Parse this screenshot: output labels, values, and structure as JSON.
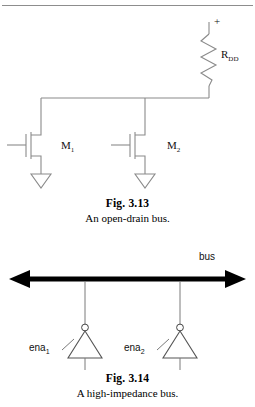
{
  "page": {
    "background": "#ffffff",
    "width": 255,
    "height": 407,
    "has_top_rule": true
  },
  "figures": [
    {
      "id": "fig-3-13",
      "number": "Fig. 3.13",
      "caption": "An open-drain bus.",
      "diagram_type": "circuit-schematic",
      "description": "Open-drain bus with pull-up resistor and two NMOS transistors",
      "labels": {
        "supply_terminal": "+",
        "resistor": {
          "base": "R",
          "subscript": "DD"
        },
        "transistor_1": {
          "base": "M",
          "subscript": "1"
        },
        "transistor_2": {
          "base": "M",
          "subscript": "2"
        }
      },
      "components": [
        {
          "name": "pull-up-resistor",
          "label": "R",
          "sub": "DD"
        },
        {
          "name": "nmos-transistor-m1",
          "label": "M",
          "sub": "1"
        },
        {
          "name": "nmos-transistor-m2",
          "label": "M",
          "sub": "2"
        },
        {
          "name": "ground-symbol-1",
          "label": ""
        },
        {
          "name": "ground-symbol-2",
          "label": ""
        },
        {
          "name": "bus-wire",
          "label": ""
        }
      ]
    },
    {
      "id": "fig-3-14",
      "number": "Fig. 3.14",
      "caption": "A high-impedance bus.",
      "diagram_type": "circuit-schematic",
      "description": "Bidirectional bus driven by two tri-state inverting buffers",
      "labels": {
        "bus": "bus",
        "enable_1": {
          "base": "ena",
          "subscript": "1"
        },
        "enable_2": {
          "base": "ena",
          "subscript": "2"
        }
      },
      "components": [
        {
          "name": "bidirectional-bus-arrow",
          "label": "bus"
        },
        {
          "name": "tristate-buffer-1",
          "label": "ena",
          "sub": "1"
        },
        {
          "name": "tristate-buffer-2",
          "label": "ena",
          "sub": "2"
        },
        {
          "name": "inverter-bubble-1",
          "label": ""
        },
        {
          "name": "inverter-bubble-2",
          "label": ""
        }
      ]
    }
  ],
  "colors": {
    "ink": "#111111",
    "wire": "#8a8a8a",
    "bus": "#000000",
    "rule": "#8d8d8d",
    "background": "#ffffff"
  }
}
